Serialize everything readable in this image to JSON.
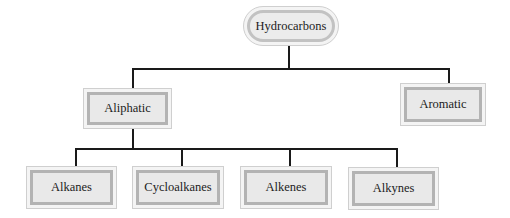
{
  "diagram": {
    "type": "tree",
    "root": {
      "label": "Hydrocarbons"
    },
    "level1": [
      {
        "label": "Aliphatic"
      },
      {
        "label": "Aromatic"
      }
    ],
    "level2": [
      {
        "label": "Alkanes",
        "parent": "Aliphatic"
      },
      {
        "label": "Cycloalkanes",
        "parent": "Aliphatic"
      },
      {
        "label": "Alkenes",
        "parent": "Aliphatic"
      },
      {
        "label": "Alkynes",
        "parent": "Aliphatic"
      }
    ]
  },
  "colors": {
    "line": "#1a1a1a",
    "box_fill": "#e9e9e9",
    "box_border": "#b3b3b3",
    "text": "#1c1c1c"
  }
}
